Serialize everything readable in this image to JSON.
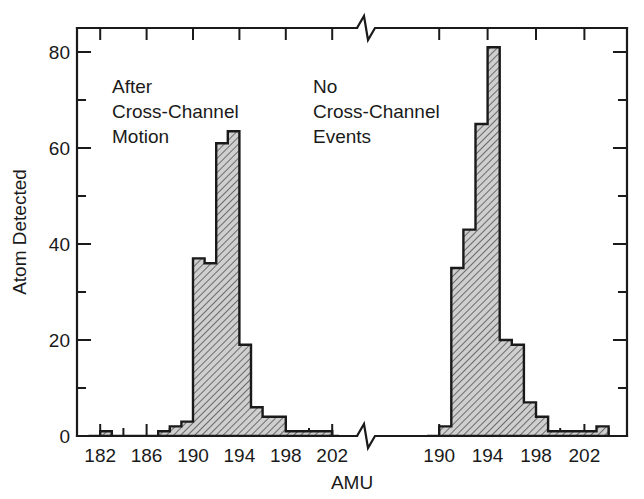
{
  "chart_data": {
    "type": "bar",
    "title": "",
    "subtitle": "",
    "xlabel": "AMU",
    "ylabel": "Atom Detected",
    "grid": false,
    "legend_position": "none",
    "ylim": [
      0,
      85
    ],
    "y_ticks": [
      0,
      20,
      40,
      60,
      80
    ],
    "y_ticks_minor": [
      10,
      30,
      50,
      70
    ],
    "axis_break": true,
    "axis_break_note": "x-axis is broken between the two panels; zigzag break marks appear on both the top and bottom frame edges",
    "panels": [
      {
        "name": "left",
        "annotation": [
          "After",
          "Cross-Channel",
          "Motion"
        ],
        "xlim": [
          180,
          203
        ],
        "x_ticks": [
          182,
          186,
          190,
          194,
          198,
          202
        ],
        "x_ticks_minor": [
          184,
          188,
          192,
          196,
          200
        ],
        "bin_width": 1,
        "categories": [
          181,
          182,
          183,
          184,
          185,
          186,
          187,
          188,
          189,
          190,
          191,
          192,
          193,
          194,
          195,
          196,
          197,
          198,
          199,
          200,
          201,
          202
        ],
        "values": [
          0,
          1,
          0,
          0,
          0,
          0,
          1,
          2,
          3,
          37,
          36,
          61,
          63.5,
          19,
          6,
          4,
          4,
          1,
          1,
          1,
          1,
          0
        ]
      },
      {
        "name": "right",
        "annotation": [
          "No",
          "Cross-Channel",
          "Events"
        ],
        "xlim": [
          188,
          204
        ],
        "x_ticks": [
          190,
          194,
          198,
          202
        ],
        "x_ticks_minor": [
          192,
          196,
          200,
          204
        ],
        "bin_width": 1,
        "categories": [
          189,
          190,
          191,
          192,
          193,
          194,
          195,
          196,
          197,
          198,
          199,
          200,
          201,
          202,
          203
        ],
        "values": [
          0,
          2,
          35,
          43,
          65,
          81,
          20,
          19,
          7,
          4,
          1,
          1,
          1,
          1,
          2
        ]
      }
    ]
  },
  "axes": {
    "y_title": "Atom Detected",
    "x_title": "AMU",
    "y_tick_labels": [
      "0",
      "20",
      "40",
      "60",
      "80"
    ],
    "x_tick_labels_left": [
      "182",
      "186",
      "190",
      "194",
      "198",
      "202"
    ],
    "x_tick_labels_right": [
      "190",
      "194",
      "198",
      "202"
    ]
  },
  "annotations": {
    "left": {
      "line1": "After",
      "line2": "Cross-Channel",
      "line3": "Motion"
    },
    "right": {
      "line1": "No",
      "line2": "Cross-Channel",
      "line3": "Events"
    }
  },
  "colors": {
    "ink": "#1a1a1a",
    "background": "#ffffff",
    "bar_fill": "#c8c8c8",
    "hatch": "#555555"
  }
}
